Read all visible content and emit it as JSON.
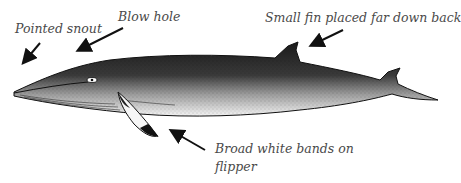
{
  "diagram": {
    "labels": {
      "snout": "Pointed snout",
      "blowhole": "Blow hole",
      "fin": "Small fin placed far down back",
      "flipper_line1": "Broad white bands on",
      "flipper_line2": "flipper"
    },
    "colors": {
      "label_text": "#4a4a4a",
      "arrow": "#111111",
      "whale_dark": "#1a1a1a",
      "whale_mid": "#6a6a6a",
      "belly": "#f4f4f4"
    }
  }
}
